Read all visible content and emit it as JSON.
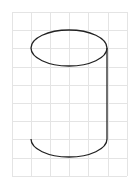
{
  "figure": {
    "kind": "cylinder-on-grid"
  },
  "grid": {
    "x0": 12,
    "y0": 12,
    "x1": 127,
    "y1": 176,
    "cell_w": 19.1,
    "cell_h": 18.2,
    "cols": 6,
    "rows": 9,
    "color": "#e4e4e4"
  },
  "cylinder": {
    "stroke": "#222222",
    "stroke_width": 1.3,
    "top_ellipse": {
      "cx": 69,
      "cy": 48,
      "rx": 38,
      "ry": 18
    },
    "bottom_arc": {
      "cx": 69,
      "cy": 139,
      "rx": 38,
      "ry": 18
    },
    "right_edge": {
      "x": 107,
      "y1": 48,
      "y2": 139
    },
    "left_edge_visible": false
  }
}
